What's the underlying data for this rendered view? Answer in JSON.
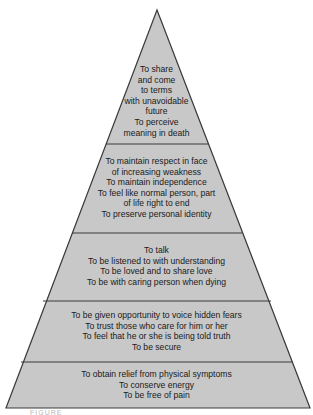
{
  "diagram": {
    "type": "pyramid",
    "fill_color": "#c8c8c8",
    "stroke_color": "#3a3a3a",
    "layers": [
      {
        "level": 5,
        "lines": [
          "To share",
          "and come",
          "to terms",
          "with unavoidable",
          "future",
          "To perceive",
          "meaning in death"
        ]
      },
      {
        "level": 4,
        "lines": [
          "To maintain respect in face",
          "of increasing weakness",
          "To maintain independence",
          "To feel like normal person, part",
          "of life right to end",
          "To preserve personal identity"
        ]
      },
      {
        "level": 3,
        "lines": [
          "To talk",
          "To be listened to with understanding",
          "To be loved and to share love",
          "To be with caring person when dying"
        ]
      },
      {
        "level": 2,
        "lines": [
          "To be given opportunity to voice hidden fears",
          "To trust those who care for him or her",
          "To feel that he or she is being told truth",
          "To be secure"
        ]
      },
      {
        "level": 1,
        "lines": [
          "To obtain relief from physical symptoms",
          "To conserve energy",
          "To be free of pain"
        ]
      }
    ],
    "caption": "FIGURE"
  }
}
